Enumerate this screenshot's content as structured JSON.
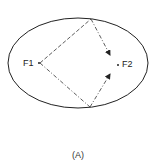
{
  "diagram": {
    "focus_1_label": "F1",
    "focus_2_label": "F2",
    "caption": "(A)",
    "ellipse": {
      "cx": 78,
      "cy": 63,
      "rx": 70,
      "ry": 45
    },
    "focus_1": {
      "x": 39,
      "y": 63
    },
    "focus_2": {
      "x": 118,
      "y": 65
    },
    "reflection_points": [
      {
        "x": 91,
        "y": 19
      },
      {
        "x": 90,
        "y": 107
      }
    ],
    "stroke_color": "#222222"
  }
}
